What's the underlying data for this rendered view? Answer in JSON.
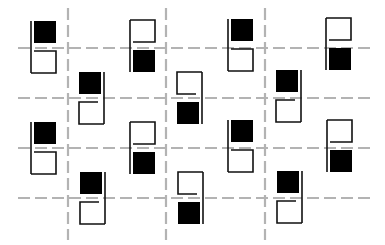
{
  "figure": {
    "type": "geometric-pattern",
    "width": 385,
    "height": 245,
    "background": "#ffffff",
    "colors": {
      "ink": "#111111",
      "fill": "#000000",
      "grid": "#b3b3b3"
    },
    "grid": {
      "vertical_lines": [
        {
          "x": 68,
          "y1": 8,
          "y2": 240
        },
        {
          "x": 166,
          "y1": 8,
          "y2": 240
        },
        {
          "x": 265,
          "y1": 8,
          "y2": 240
        }
      ],
      "horizontal_lines": [
        {
          "y": 48,
          "x1": 18,
          "x2": 370
        },
        {
          "y": 98,
          "x1": 18,
          "x2": 370
        },
        {
          "y": 148,
          "x1": 18,
          "x2": 370
        },
        {
          "y": 198,
          "x1": 18,
          "x2": 370
        }
      ],
      "dash": "12 5"
    },
    "units": [
      {
        "id": "r1c1",
        "x": 31,
        "y": 21,
        "filled": "top",
        "spine": "left"
      },
      {
        "id": "r1c2",
        "x": 130,
        "y": 20,
        "filled": "bottom",
        "spine": "left"
      },
      {
        "id": "r1c3",
        "x": 228,
        "y": 19,
        "filled": "top",
        "spine": "left"
      },
      {
        "id": "r1c4",
        "x": 326,
        "y": 18,
        "filled": "bottom",
        "spine": "left"
      },
      {
        "id": "r2c1",
        "x": 79,
        "y": 72,
        "filled": "top",
        "spine": "right"
      },
      {
        "id": "r2c2",
        "x": 177,
        "y": 72,
        "filled": "bottom",
        "spine": "right"
      },
      {
        "id": "r2c3",
        "x": 276,
        "y": 70,
        "filled": "top",
        "spine": "right"
      },
      {
        "id": "r3c1",
        "x": 31,
        "y": 122,
        "filled": "top",
        "spine": "left"
      },
      {
        "id": "r3c2",
        "x": 130,
        "y": 122,
        "filled": "bottom",
        "spine": "left"
      },
      {
        "id": "r3c3",
        "x": 228,
        "y": 120,
        "filled": "top",
        "spine": "left"
      },
      {
        "id": "r3c4",
        "x": 327,
        "y": 120,
        "filled": "bottom",
        "spine": "left"
      },
      {
        "id": "r4c1",
        "x": 80,
        "y": 172,
        "filled": "top",
        "spine": "right"
      },
      {
        "id": "r4c2",
        "x": 178,
        "y": 172,
        "filled": "bottom",
        "spine": "right"
      },
      {
        "id": "r4c3",
        "x": 277,
        "y": 171,
        "filled": "top",
        "spine": "right"
      }
    ],
    "unit_size": {
      "square": 22,
      "gap": 8,
      "stroke": 1.6
    }
  }
}
